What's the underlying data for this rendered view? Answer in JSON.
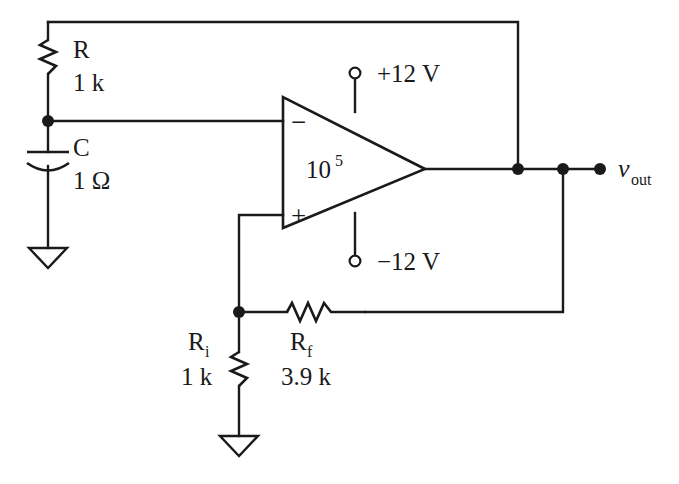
{
  "diagram": {
    "stroke_color": "#1a1a1a",
    "background_color": "#ffffff"
  },
  "components": {
    "resistor_r": {
      "symbol_name": "resistor",
      "label": "R",
      "value": "1 k"
    },
    "capacitor_c": {
      "symbol_name": "capacitor",
      "label": "C",
      "value": "1 Ω"
    },
    "resistor_ri": {
      "symbol_name": "resistor",
      "label": "R",
      "subscript": "i",
      "value": "1  k"
    },
    "resistor_rf": {
      "symbol_name": "resistor",
      "label": "R",
      "subscript": "f",
      "value": "3.9 k"
    },
    "opamp": {
      "symbol_name": "operational-amplifier",
      "gain_mantissa": "10",
      "gain_exponent": "5",
      "inverting_sign": "−",
      "noninverting_sign": "+",
      "supply_positive": "+12 V",
      "supply_negative": "−12 V"
    },
    "output": {
      "label_var": "v",
      "label_sub": "out"
    },
    "ground_left": {
      "symbol_name": "ground"
    },
    "ground_bottom": {
      "symbol_name": "ground"
    }
  }
}
